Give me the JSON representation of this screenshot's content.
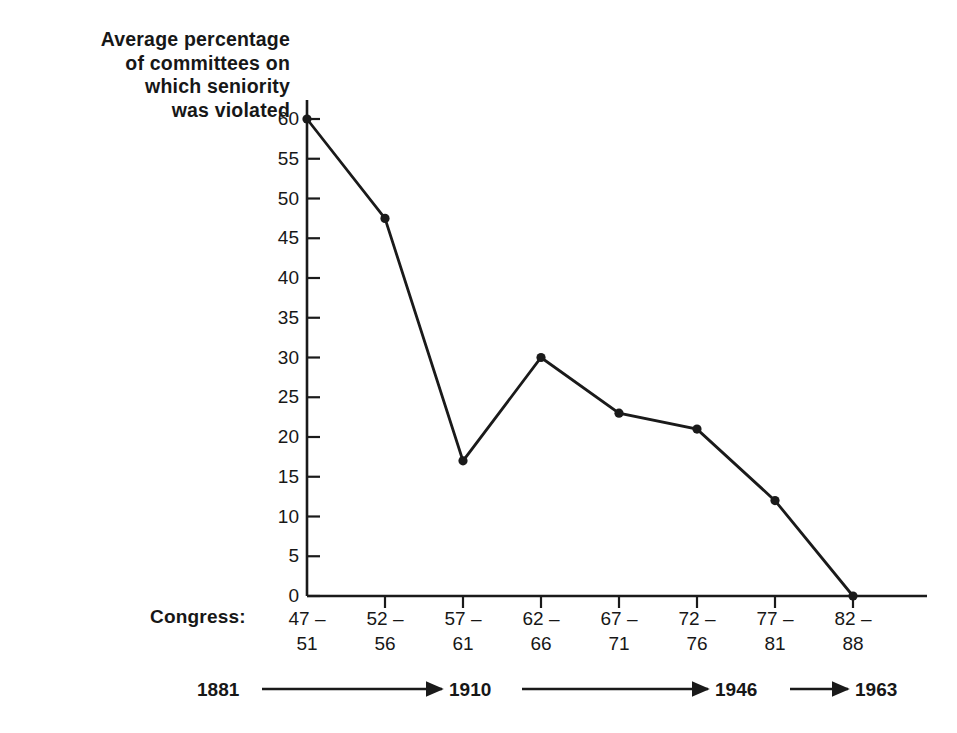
{
  "chart_data": {
    "type": "line",
    "title": "Average percentage of committees on which seniority was violated",
    "title_lines": [
      "Average percentage",
      "of committees on",
      "which seniority",
      "was violated"
    ],
    "xlabel": "Congress:",
    "ylabel": "Average percentage of committees on which seniority was violated",
    "categories": [
      "47-51",
      "52-56",
      "57-61",
      "62-66",
      "67-71",
      "72-76",
      "77-81",
      "82-88"
    ],
    "category_lines": [
      {
        "top": "47 –",
        "bottom": "51"
      },
      {
        "top": "52 –",
        "bottom": "56"
      },
      {
        "top": "57 –",
        "bottom": "61"
      },
      {
        "top": "62 –",
        "bottom": "66"
      },
      {
        "top": "67 –",
        "bottom": "71"
      },
      {
        "top": "72 –",
        "bottom": "76"
      },
      {
        "top": "77 –",
        "bottom": "81"
      },
      {
        "top": "82 –",
        "bottom": "88"
      }
    ],
    "values": [
      60,
      47.5,
      17,
      30,
      23,
      21,
      12,
      0
    ],
    "ylim": [
      0,
      60
    ],
    "yticks": [
      0,
      5,
      10,
      15,
      20,
      25,
      30,
      35,
      40,
      45,
      50,
      55,
      60
    ],
    "ytick_labels": [
      "0",
      "5",
      "10",
      "15",
      "20",
      "25",
      "30",
      "35",
      "40",
      "45",
      "50",
      "55",
      "60"
    ],
    "grid": false,
    "legend": false,
    "line_color": "#1a1a1a",
    "marker_color": "#1a1a1a",
    "axis_color": "#1a1a1a",
    "background": "#ffffff"
  },
  "era_timeline": {
    "segments": [
      {
        "label": "1881"
      },
      {
        "label": "1910"
      },
      {
        "label": "1946"
      },
      {
        "label": "1963"
      }
    ]
  }
}
